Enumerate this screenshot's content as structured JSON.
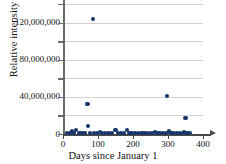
{
  "chart_data": {
    "type": "scatter",
    "title": "",
    "xlabel": "Days since January 1",
    "ylabel": "Relative intensity",
    "xlim": [
      0,
      400
    ],
    "ylim": [
      0,
      140000000
    ],
    "grid": true,
    "legend": null,
    "x_ticks": [
      0,
      100,
      200,
      300,
      400
    ],
    "x_tick_labels": [
      "0",
      "100",
      "200",
      "300",
      "400"
    ],
    "y_ticks": [
      0,
      20000000,
      40000000,
      60000000,
      80000000,
      100000000,
      120000000,
      140000000
    ],
    "y_tick_labels": [
      "0",
      "",
      "40,000,000",
      "",
      "80,000,000",
      "",
      "120,000,000",
      ""
    ],
    "y_labeled_ticks": [
      {
        "value": 0,
        "label": "0"
      },
      {
        "value": 40000000,
        "label": "40,000,000"
      },
      {
        "value": 80000000,
        "label": "80,000,000"
      },
      {
        "value": 120000000,
        "label": "120,000,000"
      }
    ],
    "marker_color": "#16366b",
    "gridline_color": "#d2d2d2",
    "axis_color": "#4a4a4a",
    "points": [
      {
        "x": 85,
        "y": 124000000
      },
      {
        "x": 70,
        "y": 32000000
      },
      {
        "x": 298,
        "y": 40500000
      },
      {
        "x": 350,
        "y": 17000000
      },
      {
        "x": 72,
        "y": 8500000
      },
      {
        "x": 38,
        "y": 4200000
      },
      {
        "x": 105,
        "y": 2200000
      },
      {
        "x": 150,
        "y": 4500000
      },
      {
        "x": 182,
        "y": 4200000
      },
      {
        "x": 262,
        "y": 2300000
      },
      {
        "x": 302,
        "y": 2600000
      },
      {
        "x": 345,
        "y": 2400000
      },
      {
        "x": 12,
        "y": 900000
      },
      {
        "x": 20,
        "y": 1200000
      },
      {
        "x": 26,
        "y": 2600000
      },
      {
        "x": 32,
        "y": 1400000
      },
      {
        "x": 45,
        "y": 1100000
      },
      {
        "x": 52,
        "y": 900000
      },
      {
        "x": 58,
        "y": 1300000
      },
      {
        "x": 64,
        "y": 900000
      },
      {
        "x": 78,
        "y": 900000
      },
      {
        "x": 88,
        "y": 900000
      },
      {
        "x": 96,
        "y": 900000
      },
      {
        "x": 112,
        "y": 900000
      },
      {
        "x": 120,
        "y": 1000000
      },
      {
        "x": 130,
        "y": 900000
      },
      {
        "x": 140,
        "y": 900000
      },
      {
        "x": 158,
        "y": 900000
      },
      {
        "x": 166,
        "y": 900000
      },
      {
        "x": 174,
        "y": 900000
      },
      {
        "x": 190,
        "y": 900000
      },
      {
        "x": 198,
        "y": 900000
      },
      {
        "x": 206,
        "y": 900000
      },
      {
        "x": 214,
        "y": 900000
      },
      {
        "x": 222,
        "y": 900000
      },
      {
        "x": 230,
        "y": 900000
      },
      {
        "x": 238,
        "y": 900000
      },
      {
        "x": 246,
        "y": 900000
      },
      {
        "x": 254,
        "y": 900000
      },
      {
        "x": 270,
        "y": 900000
      },
      {
        "x": 278,
        "y": 900000
      },
      {
        "x": 286,
        "y": 900000
      },
      {
        "x": 294,
        "y": 900000
      },
      {
        "x": 310,
        "y": 900000
      },
      {
        "x": 318,
        "y": 900000
      },
      {
        "x": 326,
        "y": 900000
      },
      {
        "x": 334,
        "y": 900000
      },
      {
        "x": 342,
        "y": 900000
      },
      {
        "x": 352,
        "y": 900000
      },
      {
        "x": 358,
        "y": 900000
      },
      {
        "x": 364,
        "y": 900000
      }
    ]
  }
}
